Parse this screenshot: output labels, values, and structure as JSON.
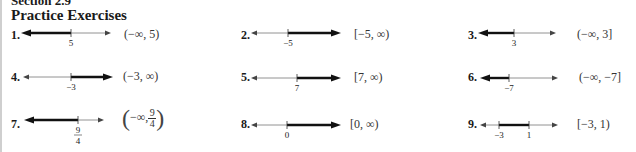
{
  "section": {
    "title": "Section 2.9",
    "heading": "Practice Exercises"
  },
  "exercises": [
    {
      "num": "1.",
      "answer": "(−∞, 5)",
      "ticks": [
        "5"
      ],
      "shade": "left",
      "type": "ray"
    },
    {
      "num": "2.",
      "answer": "[−5, ∞)",
      "ticks": [
        "−5"
      ],
      "shade": "right",
      "type": "ray"
    },
    {
      "num": "3.",
      "answer": "(−∞, 3]",
      "ticks": [
        "3"
      ],
      "shade": "left",
      "type": "ray"
    },
    {
      "num": "4.",
      "answer": "(−3, ∞)",
      "ticks": [
        "−3"
      ],
      "shade": "right",
      "type": "ray"
    },
    {
      "num": "5.",
      "answer": "[7, ∞)",
      "ticks": [
        "7"
      ],
      "shade": "right",
      "type": "ray"
    },
    {
      "num": "6.",
      "answer": "(−∞, −7]",
      "ticks": [
        "−7"
      ],
      "shade": "left",
      "type": "ray"
    },
    {
      "num": "7.",
      "answer_prefix": "−∞,",
      "answer_frac_num": "9",
      "answer_frac_den": "4",
      "ticks_num": "9",
      "ticks_den": "4",
      "shade": "left",
      "type": "ray"
    },
    {
      "num": "8.",
      "answer": "[0, ∞)",
      "ticks": [
        "0"
      ],
      "shade": "right",
      "type": "ray"
    },
    {
      "num": "9.",
      "answer": "[−3, 1)",
      "ticks": [
        "−3",
        "1"
      ],
      "shade": "between",
      "type": "segment"
    }
  ]
}
